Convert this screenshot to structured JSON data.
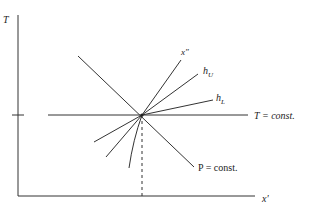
{
  "diagram": {
    "axes": {
      "y_label": "T",
      "x_label": "x'"
    },
    "lines": {
      "isotherm_label": "T = const.",
      "isobar_label": "P = const.",
      "x_double_prime_label": "x\"",
      "h_upper_label": "h",
      "h_upper_sub": "U",
      "h_lower_label": "h",
      "h_lower_sub": "L"
    },
    "colors": {
      "line": "#333333",
      "background": "#ffffff"
    }
  }
}
